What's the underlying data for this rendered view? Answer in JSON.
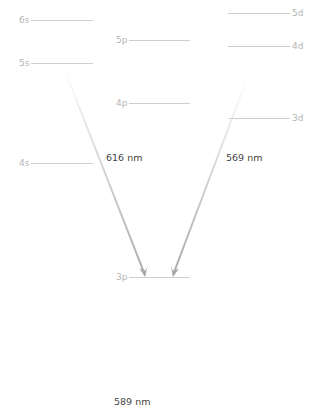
{
  "diagram": {
    "title": "",
    "levels": [
      {
        "label": "6s",
        "y": 20,
        "x1": 31,
        "x2": 93,
        "label_side": "left"
      },
      {
        "label": "5s",
        "y": 63,
        "x1": 31,
        "x2": 93,
        "label_side": "left"
      },
      {
        "label": "4s",
        "y": 163,
        "x1": 31,
        "x2": 93,
        "label_side": "left"
      },
      {
        "label": "5p",
        "y": 40,
        "x1": 129,
        "x2": 190,
        "label_side": "left"
      },
      {
        "label": "4p",
        "y": 103,
        "x1": 129,
        "x2": 190,
        "label_side": "left"
      },
      {
        "label": "3p",
        "y": 277,
        "x1": 129,
        "x2": 190,
        "label_side": "left"
      },
      {
        "label": "5d",
        "y": 13,
        "x1": 228,
        "x2": 290,
        "label_side": "right"
      },
      {
        "label": "4d",
        "y": 46,
        "x1": 228,
        "x2": 290,
        "label_side": "right"
      },
      {
        "label": "3d",
        "y": 118,
        "x1": 228,
        "x2": 290,
        "label_side": "right"
      }
    ],
    "transitions": [
      {
        "from": "5s",
        "to": "3p",
        "wavelength": "616 nm",
        "x1": 63,
        "y1": 66,
        "x2": 145,
        "y2": 275
      },
      {
        "from": "4d",
        "to": "3p",
        "wavelength": "569 nm",
        "x1": 248,
        "y1": 76,
        "x2": 173,
        "y2": 275
      }
    ],
    "labels": {
      "t616": "616 nm",
      "t569": "569 nm",
      "t589": "589 nm"
    },
    "colors": {
      "level_line": "#cfcfcf",
      "level_text": "#b5b5b5",
      "arrow": "#aaaaaa",
      "wavelength_text": "#444444"
    }
  }
}
